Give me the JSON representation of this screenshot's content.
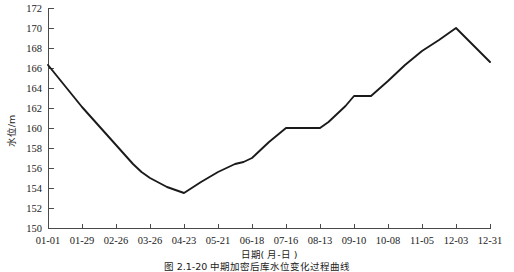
{
  "figure": {
    "caption": "图 2.1-20   中期加密后库水位变化过程曲线",
    "background_color": "#ffffff",
    "line_color": "#1a1a1a",
    "axis_color": "#4a4a4a"
  },
  "chart_data": {
    "type": "line",
    "title": "",
    "xlabel": "日期( 月-日 )",
    "ylabel": "水位/m",
    "ylim": [
      150,
      172
    ],
    "ytick_step": 2,
    "yticks": [
      150,
      152,
      154,
      156,
      158,
      160,
      162,
      164,
      166,
      168,
      170,
      172
    ],
    "categories": [
      "01-01",
      "01-29",
      "02-26",
      "03-26",
      "04-23",
      "05-21",
      "06-18",
      "07-16",
      "08-13",
      "09-10",
      "10-08",
      "11-05",
      "12-03",
      "12-31"
    ],
    "grid": false,
    "legend": null,
    "series": [
      {
        "name": "库水位",
        "units": "m",
        "x": [
          "01-01",
          "01-15",
          "01-29",
          "02-12",
          "02-26",
          "03-12",
          "03-19",
          "03-26",
          "04-09",
          "04-23",
          "05-07",
          "05-21",
          "06-04",
          "06-11",
          "06-18",
          "07-02",
          "07-16",
          "08-13",
          "08-20",
          "09-03",
          "09-10",
          "09-24",
          "10-08",
          "10-22",
          "11-05",
          "11-19",
          "12-03",
          "12-31"
        ],
        "values": [
          166.3,
          164.2,
          162.1,
          160.2,
          158.3,
          156.4,
          155.6,
          155.0,
          154.1,
          153.5,
          154.6,
          155.6,
          156.4,
          156.6,
          157.0,
          158.6,
          160.0,
          160.0,
          160.6,
          162.2,
          163.2,
          163.2,
          164.7,
          166.3,
          167.7,
          168.8,
          170.0,
          166.6
        ]
      }
    ],
    "annotations": []
  }
}
